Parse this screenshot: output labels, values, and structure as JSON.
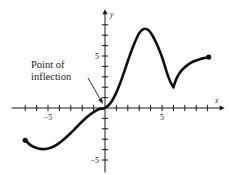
{
  "figure": {
    "background_color": "#ffffff",
    "curve_color": "#101010",
    "axis_color": "#1a1a1a"
  },
  "annotation": {
    "line1": "Point of",
    "line2": "inflection",
    "target_label": "origin",
    "arrow_from": [
      88,
      78
    ],
    "arrow_to": [
      103,
      104
    ]
  },
  "axes": {
    "x_axis_label": "x",
    "y_axis_label": "y",
    "x_tick_labels": [
      {
        "text": "−5",
        "value": -5
      },
      {
        "text": "5",
        "value": 5
      }
    ],
    "y_tick_labels": [
      {
        "text": "5",
        "value": 5
      },
      {
        "text": "−5",
        "value": -5
      }
    ],
    "origin_px": [
      105,
      108
    ],
    "x_unit_px": 11.4,
    "y_unit_px": 10.4,
    "x_range": [
      -8.2,
      10.5
    ],
    "y_range": [
      -6.2,
      9.5
    ],
    "grid": false
  },
  "chart_data": {
    "type": "line",
    "title": "",
    "xlabel": "x",
    "ylabel": "y",
    "xlim": [
      -8.2,
      10.5
    ],
    "ylim": [
      -6.2,
      9.5
    ],
    "grid": false,
    "legend": "none",
    "annotations": [
      {
        "text": "Point of inflection",
        "points_to_x": 0,
        "points_to_y": 0,
        "text_x": -6.5,
        "text_y": 3.0
      }
    ],
    "endpoints": [
      {
        "x": -7.0,
        "y": -3.1,
        "style": "filled-dot"
      },
      {
        "x": 9.1,
        "y": 4.9,
        "style": "filled-dot"
      }
    ],
    "features": [
      {
        "kind": "local-minimum",
        "x": -5.0,
        "y": -3.9
      },
      {
        "kind": "inflection",
        "x": 0.0,
        "y": 0.0
      },
      {
        "kind": "local-maximum",
        "x": 3.4,
        "y": 7.6
      },
      {
        "kind": "cusp-minimum",
        "x": 6.0,
        "y": 2.0
      }
    ],
    "series": [
      {
        "name": "f(x)",
        "x": [
          -7.0,
          -6.5,
          -6.0,
          -5.5,
          -5.0,
          -4.5,
          -4.0,
          -3.5,
          -3.0,
          -2.5,
          -2.0,
          -1.5,
          -1.0,
          -0.5,
          0.0,
          0.5,
          1.0,
          1.5,
          2.0,
          2.5,
          3.0,
          3.4,
          3.8,
          4.2,
          4.6,
          5.0,
          5.4,
          5.7,
          6.0,
          6.3,
          6.7,
          7.2,
          7.7,
          8.2,
          8.7,
          9.1
        ],
        "y": [
          -3.1,
          -3.6,
          -3.85,
          -3.95,
          -3.9,
          -3.7,
          -3.35,
          -2.9,
          -2.4,
          -1.85,
          -1.3,
          -0.8,
          -0.4,
          -0.1,
          0.0,
          0.5,
          1.5,
          2.9,
          4.5,
          6.0,
          7.2,
          7.6,
          7.5,
          6.9,
          6.0,
          4.9,
          3.5,
          2.6,
          2.0,
          2.9,
          3.6,
          4.1,
          4.45,
          4.65,
          4.8,
          4.9
        ]
      }
    ]
  }
}
